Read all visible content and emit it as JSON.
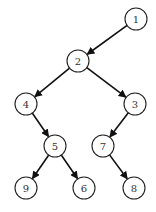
{
  "diagram": {
    "type": "binary-tree",
    "nodes": [
      {
        "id": "1",
        "label": "1",
        "x": 136,
        "y": 19
      },
      {
        "id": "2",
        "label": "2",
        "x": 78,
        "y": 61
      },
      {
        "id": "4",
        "label": "4",
        "x": 26,
        "y": 104
      },
      {
        "id": "3",
        "label": "3",
        "x": 135,
        "y": 104
      },
      {
        "id": "5",
        "label": "5",
        "x": 55,
        "y": 146
      },
      {
        "id": "7",
        "label": "7",
        "x": 103,
        "y": 146
      },
      {
        "id": "9",
        "label": "9",
        "x": 26,
        "y": 188
      },
      {
        "id": "6",
        "label": "6",
        "x": 84,
        "y": 188
      },
      {
        "id": "8",
        "label": "8",
        "x": 134,
        "y": 188
      }
    ],
    "edges": [
      {
        "from": "1",
        "to": "2"
      },
      {
        "from": "2",
        "to": "4"
      },
      {
        "from": "2",
        "to": "3"
      },
      {
        "from": "4",
        "to": "5"
      },
      {
        "from": "3",
        "to": "7"
      },
      {
        "from": "5",
        "to": "9"
      },
      {
        "from": "5",
        "to": "6"
      },
      {
        "from": "7",
        "to": "8"
      }
    ],
    "node_radius": 11
  }
}
